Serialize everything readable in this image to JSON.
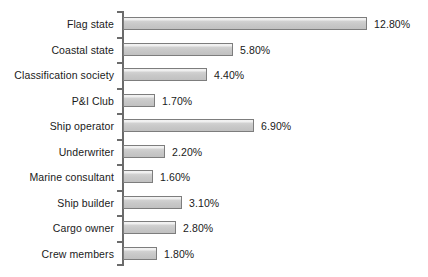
{
  "chart_data": {
    "type": "bar",
    "orientation": "horizontal",
    "title": "",
    "subtitle": "",
    "xlabel": "",
    "ylabel": "",
    "grid": false,
    "legend": false,
    "value_suffix": "%",
    "xlim": [
      0,
      13.5
    ],
    "categories": [
      "Flag state",
      "Coastal state",
      "Classification society",
      "P&I Club",
      "Ship operator",
      "Underwriter",
      "Marine consultant",
      "Ship builder",
      "Cargo owner",
      "Crew members"
    ],
    "values": [
      12.8,
      5.8,
      4.4,
      1.7,
      6.9,
      2.2,
      1.6,
      3.1,
      2.8,
      1.8
    ],
    "value_labels": [
      "12.80%",
      "5.80%",
      "4.40%",
      "1.70%",
      "6.90%",
      "2.20%",
      "1.60%",
      "3.10%",
      "2.80%",
      "1.80%"
    ],
    "colors": {
      "bar_fill": "#c9c9c9",
      "bar_highlight": "#f2f2f2",
      "bar_border": "#7d7d7d",
      "axis": "#6b6b6b",
      "text": "#1a1a1a",
      "background": "#ffffff"
    }
  }
}
